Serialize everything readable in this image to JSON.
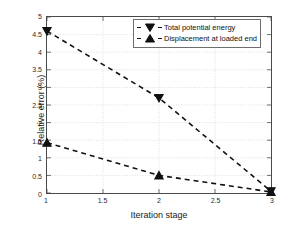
{
  "chart_data": {
    "type": "line",
    "title": "",
    "xlabel": "Iteration stage",
    "ylabel": "Relative error (%)",
    "xlim": [
      1,
      3
    ],
    "ylim": [
      0,
      5
    ],
    "xticks": [
      "1",
      "1.5",
      "2",
      "2.5",
      "3"
    ],
    "xtick_values": [
      1,
      1.5,
      2,
      2.5,
      3
    ],
    "yticks": [
      "0",
      "0.5",
      "1",
      "1.5",
      "2",
      "2.5",
      "3",
      "3.5",
      "4",
      "4.5",
      "5"
    ],
    "ytick_values": [
      0,
      0.5,
      1,
      1.5,
      2,
      2.5,
      3,
      3.5,
      4,
      4.5,
      5
    ],
    "grid": true,
    "legend_position": "top-right",
    "x": [
      1,
      2,
      3
    ],
    "series": [
      {
        "name": "Total potential energy",
        "marker": "triangle-down",
        "linestyle": "dashed",
        "color": "#111111",
        "values": [
          4.6,
          2.7,
          0.05
        ]
      },
      {
        "name": "Displacement at loaded end",
        "marker": "triangle-up",
        "linestyle": "dashed",
        "color": "#111111",
        "values": [
          1.43,
          0.5,
          0.03
        ]
      }
    ]
  },
  "legend": {
    "items": [
      {
        "label": "Total potential energy",
        "marker": "triangle-down-icon"
      },
      {
        "label": "Displacement at loaded end",
        "marker": "triangle-up-icon"
      }
    ]
  },
  "axes": {
    "x_title": "Iteration stage",
    "y_title": "Relative error (%)"
  },
  "colors": {
    "line": "#111111",
    "grid": "#c9c9c9",
    "axis": "#4a4a4a",
    "background": "#ffffff"
  }
}
